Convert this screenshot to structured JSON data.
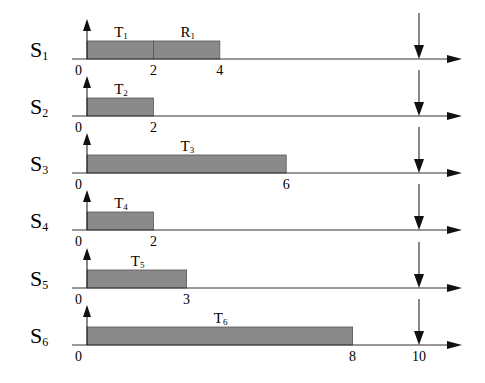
{
  "diagram": {
    "type": "timing-diagram",
    "x_scale": {
      "origin_px": 87,
      "px_per_unit": 33.2
    },
    "deadline": {
      "value": 10,
      "label": "10"
    },
    "bar_color": "#8a8a8a",
    "rows": [
      {
        "label": "S",
        "sub": "1",
        "axis_y": 59,
        "segments": [
          {
            "task": "T",
            "sub": "1",
            "start": 0,
            "end": 2
          },
          {
            "task": "R",
            "sub": "1",
            "start": 2,
            "end": 4
          }
        ],
        "ticks": [
          "0",
          "2",
          "4"
        ]
      },
      {
        "label": "S",
        "sub": "2",
        "axis_y": 116,
        "segments": [
          {
            "task": "T",
            "sub": "2",
            "start": 0,
            "end": 2
          }
        ],
        "ticks": [
          "0",
          "2"
        ]
      },
      {
        "label": "S",
        "sub": "3",
        "axis_y": 173,
        "segments": [
          {
            "task": "T",
            "sub": "3",
            "start": 0,
            "end": 6
          }
        ],
        "ticks": [
          "0",
          "6"
        ]
      },
      {
        "label": "S",
        "sub": "4",
        "axis_y": 230,
        "segments": [
          {
            "task": "T",
            "sub": "4",
            "start": 0,
            "end": 2
          }
        ],
        "ticks": [
          "0",
          "2"
        ]
      },
      {
        "label": "S",
        "sub": "5",
        "axis_y": 288,
        "segments": [
          {
            "task": "T",
            "sub": "5",
            "start": 0,
            "end": 3
          }
        ],
        "ticks": [
          "0",
          "3"
        ]
      },
      {
        "label": "S",
        "sub": "6",
        "axis_y": 345,
        "segments": [
          {
            "task": "T",
            "sub": "6",
            "start": 0,
            "end": 8
          }
        ],
        "ticks": [
          "0",
          "8",
          "10"
        ]
      }
    ]
  }
}
